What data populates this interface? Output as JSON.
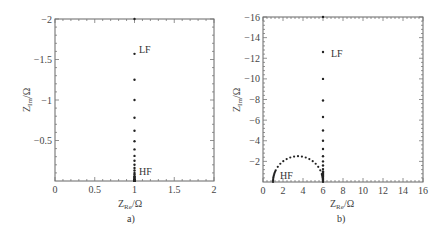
{
  "chart_data": [
    {
      "type": "scatter",
      "panel": "a)",
      "title": "",
      "xlabel": "Z_Re/Ω",
      "ylabel": "Z_Im/Ω",
      "xlim": [
        0,
        2
      ],
      "ylim": [
        0,
        -2
      ],
      "x_ticks": [
        "0",
        "0.5",
        "1",
        "1.5",
        "2"
      ],
      "y_ticks": [
        "-2",
        "-1.5",
        "-1",
        "-0.5"
      ],
      "grid": false,
      "annotations": [
        {
          "text": "LF",
          "x": 1.05,
          "y": -1.57
        },
        {
          "text": "HF",
          "x": 1.05,
          "y": -0.06
        }
      ],
      "series": [
        {
          "name": "impedance",
          "x": [
            1,
            1,
            1,
            1,
            1,
            1,
            1,
            1,
            1,
            1,
            1,
            1,
            1,
            1,
            1,
            1,
            1,
            1,
            1,
            1,
            1
          ],
          "y": [
            -2.0,
            -1.57,
            -1.25,
            -1.0,
            -0.78,
            -0.62,
            -0.49,
            -0.39,
            -0.31,
            -0.25,
            -0.2,
            -0.16,
            -0.13,
            -0.1,
            -0.08,
            -0.06,
            -0.05,
            -0.04,
            -0.03,
            -0.02,
            -0.01
          ]
        }
      ]
    },
    {
      "type": "scatter",
      "panel": "b)",
      "title": "",
      "xlabel": "Z_Re/Ω",
      "ylabel": "Z_Im/Ω",
      "xlim": [
        0,
        16
      ],
      "ylim": [
        0,
        -16
      ],
      "x_ticks": [
        "0",
        "2",
        "4",
        "6",
        "8",
        "10",
        "12",
        "14",
        "16"
      ],
      "y_ticks": [
        "-16",
        "-14",
        "-12",
        "-10",
        "-8",
        "-6",
        "-4",
        "-2"
      ],
      "grid": false,
      "annotations": [
        {
          "text": "LF",
          "x": 6.8,
          "y": -12.6
        },
        {
          "text": "HF",
          "x": 1.6,
          "y": -0.5
        }
      ],
      "series": [
        {
          "name": "semicircle",
          "center": [
            3.5,
            0
          ],
          "radius": 2.5,
          "x_range": [
            1,
            6
          ],
          "peak": {
            "x": 3.5,
            "y": -2.5
          }
        },
        {
          "name": "vertical_tail",
          "x": [
            6,
            6,
            6,
            6,
            6,
            6,
            6,
            6,
            6,
            6,
            6,
            6,
            6
          ],
          "y": [
            -16,
            -12.6,
            -10.0,
            -7.9,
            -6.3,
            -5.0,
            -4.0,
            -3.2,
            -2.5,
            -2.0,
            -1.6,
            -1.25,
            -1.0
          ]
        }
      ]
    }
  ],
  "panels": {
    "a": {
      "caption": "a)",
      "xlabel_main": "Z",
      "xlabel_sub": "Re",
      "xlabel_unit": "/Ω",
      "ylabel_main": "Z",
      "ylabel_sub": "Im",
      "ylabel_unit": "/Ω",
      "lf": "LF",
      "hf": "HF"
    },
    "b": {
      "caption": "b)",
      "xlabel_main": "Z",
      "xlabel_sub": "Re",
      "xlabel_unit": "/Ω",
      "ylabel_main": "Z",
      "ylabel_sub": "Im",
      "ylabel_unit": "/Ω",
      "lf": "LF",
      "hf": "HF"
    }
  }
}
